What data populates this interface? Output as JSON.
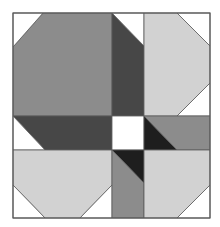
{
  "diagram": {
    "colors": {
      "white": "#ffffff",
      "medium_gray": "#8c8c8c",
      "light_gray": "#d2d2d2",
      "dark_gray": "#474747",
      "black": "#1e1e1e",
      "outline": "#5a5a5a"
    },
    "bounds": {
      "x": 13,
      "y": 13,
      "width": 197,
      "height": 205
    },
    "shapes": [
      {
        "name": "top-left-octagon",
        "fill": "medium_gray",
        "points": "43,13 112,13 112,116 13,116 13,47"
      },
      {
        "name": "top-left-corner",
        "fill": "white",
        "points": "13,13 43,13 13,47"
      },
      {
        "name": "top-center-dark-strip",
        "fill": "dark_gray",
        "points": "112,13 144,46 144,116 112,116"
      },
      {
        "name": "top-center-white-triangle",
        "fill": "white",
        "points": "112,13 144,13 144,46"
      },
      {
        "name": "top-right-octagon",
        "fill": "light_gray",
        "points": "144,13 177,13 210,46 210,83 177,116 144,116"
      },
      {
        "name": "top-right-corner-top",
        "fill": "white",
        "points": "177,13 210,13 210,46"
      },
      {
        "name": "top-right-corner-bottom",
        "fill": "white",
        "points": "210,83 210,116 177,116"
      },
      {
        "name": "left-middle-dark-band",
        "fill": "dark_gray",
        "points": "13,116 112,116 112,150 45,150"
      },
      {
        "name": "left-middle-white-triangle",
        "fill": "white",
        "points": "13,116 45,150 13,150"
      },
      {
        "name": "center-white-square",
        "fill": "white",
        "points": "112,116 144,116 144,150 112,150"
      },
      {
        "name": "right-middle-black-triangle",
        "fill": "black",
        "points": "144,116 177,150 144,150"
      },
      {
        "name": "right-middle-gray-band",
        "fill": "medium_gray",
        "points": "144,116 210,116 210,150 177,150"
      },
      {
        "name": "bottom-left-octagon",
        "fill": "light_gray",
        "points": "13,150 112,150 112,185 80,218 45,218 13,185"
      },
      {
        "name": "bottom-left-corner-left",
        "fill": "white",
        "points": "13,185 45,218 13,218"
      },
      {
        "name": "bottom-left-corner-right",
        "fill": "white",
        "points": "112,185 112,218 80,218"
      },
      {
        "name": "bottom-center-black-triangle",
        "fill": "black",
        "points": "112,150 144,150 144,183"
      },
      {
        "name": "bottom-center-gray-strip",
        "fill": "medium_gray",
        "points": "112,150 144,183 144,218 112,218"
      },
      {
        "name": "bottom-right-octagon",
        "fill": "light_gray",
        "points": "144,150 210,150 210,185 177,218 144,218"
      },
      {
        "name": "bottom-right-corner",
        "fill": "white",
        "points": "210,185 210,218 177,218"
      }
    ]
  }
}
